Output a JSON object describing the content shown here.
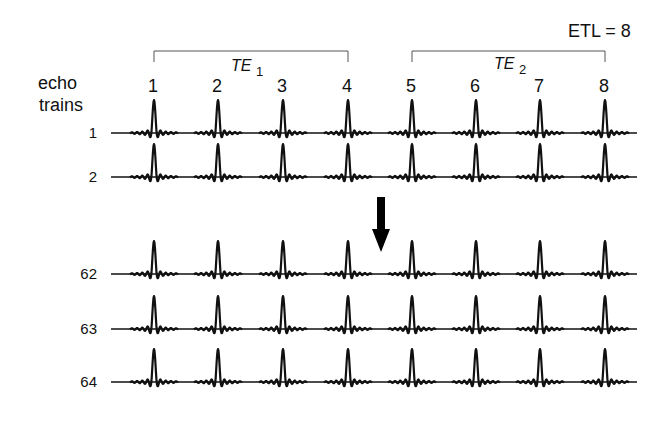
{
  "etl_label": "ETL = 8",
  "side_label": {
    "line1": "echo",
    "line2": "trains"
  },
  "groups": [
    {
      "label": "TE",
      "sub": "1",
      "from_echo": 1,
      "to_echo": 4
    },
    {
      "label": "TE",
      "sub": "2",
      "from_echo": 5,
      "to_echo": 8
    }
  ],
  "echo_numbers": [
    "1",
    "2",
    "3",
    "4",
    "5",
    "6",
    "7",
    "8"
  ],
  "echo_x": [
    154,
    218,
    283,
    348,
    412,
    476,
    540,
    605
  ],
  "trains": [
    {
      "label": "1",
      "y": 133
    },
    {
      "label": "2",
      "y": 177
    },
    {
      "label": "62",
      "y": 274
    },
    {
      "label": "63",
      "y": 329
    },
    {
      "label": "64",
      "y": 382
    }
  ],
  "arrow": {
    "direction": "down",
    "x": 381,
    "y1": 197,
    "y2": 252
  }
}
